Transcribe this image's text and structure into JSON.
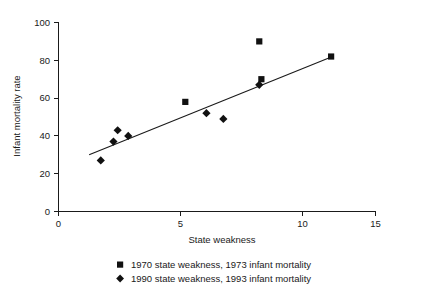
{
  "chart_data": {
    "type": "scatter",
    "title": "",
    "xlabel": "State weakness",
    "ylabel": "Infant mortality rate",
    "xlim": [
      0,
      15
    ],
    "ylim": [
      0,
      100
    ],
    "xticks": [
      0,
      5,
      10,
      15
    ],
    "yticks": [
      0,
      20,
      40,
      60,
      80,
      100
    ],
    "xtick_labels": [
      "0",
      "5",
      "10",
      "15"
    ],
    "ytick_labels": [
      "0",
      "20",
      "40",
      "60",
      "80",
      "100"
    ],
    "grid": false,
    "legend_position": "below",
    "series": [
      {
        "name": "1970 state weakness, 1973 infant mortality",
        "marker": "square",
        "color": "#111111",
        "points": [
          {
            "x": 6.0,
            "y": 58
          },
          {
            "x": 9.5,
            "y": 90
          },
          {
            "x": 9.6,
            "y": 70
          },
          {
            "x": 12.9,
            "y": 82
          }
        ]
      },
      {
        "name": "1990 state weakness, 1993 infant mortality",
        "marker": "diamond",
        "color": "#111111",
        "points": [
          {
            "x": 2.0,
            "y": 27
          },
          {
            "x": 2.6,
            "y": 37
          },
          {
            "x": 2.8,
            "y": 43
          },
          {
            "x": 3.3,
            "y": 40
          },
          {
            "x": 7.0,
            "y": 52
          },
          {
            "x": 7.8,
            "y": 49
          },
          {
            "x": 9.5,
            "y": 67
          }
        ]
      }
    ],
    "annotations": [
      {
        "type": "fit-line",
        "label": "linear trend line",
        "x0": 1.45,
        "y0": 30,
        "x1": 12.85,
        "y1": 81.5
      }
    ]
  },
  "axes": {
    "y_axis_title": "Infant mortality rate",
    "x_axis_title": "State weakness"
  },
  "legend": {
    "entries": [
      {
        "marker": "square",
        "label": "1970 state weakness, 1973 infant mortality"
      },
      {
        "marker": "diamond",
        "label": "1990 state weakness, 1993 infant mortality"
      }
    ]
  }
}
